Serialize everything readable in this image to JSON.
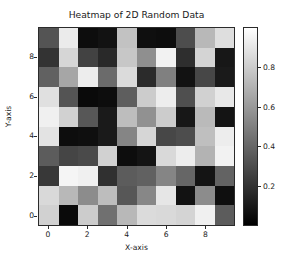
{
  "chart_data": {
    "type": "heatmap",
    "title": "Heatmap of 2D Random Data",
    "xlabel": "X-axis",
    "ylabel": "Y-axis",
    "colormap": "gray",
    "grid": false,
    "legend_position": "right",
    "vmin": 0.0,
    "vmax": 1.0,
    "xlim": [
      -0.5,
      9.5
    ],
    "ylim": [
      9.5,
      -0.5
    ],
    "x_ticks": [
      "0",
      "2",
      "4",
      "6",
      "8"
    ],
    "x_tick_values": [
      0,
      2,
      4,
      6,
      8
    ],
    "y_ticks": [
      "0",
      "2",
      "4",
      "6",
      "8"
    ],
    "y_tick_values": [
      0,
      2,
      4,
      6,
      8
    ],
    "colorbar": {
      "ticks": [
        "0.2",
        "0.4",
        "0.6",
        "0.8"
      ],
      "tick_values": [
        0.2,
        0.4,
        0.6,
        0.8
      ],
      "low_color": "#000000",
      "high_color": "#ffffff",
      "orientation": "vertical"
    },
    "rows": 10,
    "cols": 10,
    "values": [
      [
        0.33,
        0.92,
        0.05,
        0.07,
        0.76,
        0.06,
        0.05,
        0.3,
        0.72,
        0.87
      ],
      [
        0.2,
        0.84,
        0.26,
        0.16,
        0.78,
        0.56,
        0.95,
        0.18,
        0.83,
        0.09
      ],
      [
        0.38,
        0.65,
        0.93,
        0.42,
        0.86,
        0.17,
        0.5,
        0.07,
        0.28,
        0.1
      ],
      [
        0.88,
        0.33,
        0.04,
        0.05,
        0.37,
        0.8,
        0.93,
        0.31,
        0.82,
        0.91
      ],
      [
        0.94,
        0.82,
        0.34,
        0.1,
        0.74,
        0.57,
        0.8,
        0.09,
        0.73,
        0.08
      ],
      [
        0.89,
        0.05,
        0.06,
        0.1,
        0.52,
        0.84,
        0.28,
        0.3,
        0.75,
        0.93
      ],
      [
        0.36,
        0.27,
        0.29,
        0.82,
        0.05,
        0.08,
        0.85,
        0.93,
        0.7,
        0.95
      ],
      [
        0.22,
        0.96,
        0.94,
        0.19,
        0.36,
        0.38,
        0.52,
        0.4,
        0.08,
        0.39
      ],
      [
        0.85,
        0.72,
        0.55,
        0.74,
        0.34,
        0.53,
        0.9,
        0.07,
        0.55,
        0.06
      ],
      [
        0.82,
        0.04,
        0.8,
        0.44,
        0.72,
        0.86,
        0.85,
        0.83,
        0.94,
        0.36
      ]
    ]
  }
}
